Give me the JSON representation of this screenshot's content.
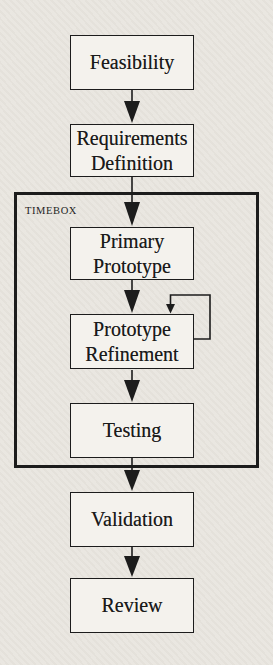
{
  "diagram": {
    "type": "flowchart",
    "colors": {
      "background": "#e9e6e0",
      "node_fill": "#f4f2ed",
      "border": "#1c1c1c",
      "text": "#1a1a1a"
    },
    "nodes": [
      {
        "id": "feasibility",
        "label": "Feasibility"
      },
      {
        "id": "requirements-definition",
        "label": "Requirements Definition"
      },
      {
        "id": "primary-prototype",
        "label": "Primary Prototype"
      },
      {
        "id": "prototype-refinement",
        "label": "Prototype Refinement"
      },
      {
        "id": "testing",
        "label": "Testing"
      },
      {
        "id": "validation",
        "label": "Validation"
      },
      {
        "id": "review",
        "label": "Review"
      }
    ],
    "container": {
      "label": "TIMEBOX",
      "contains": [
        "primary-prototype",
        "prototype-refinement",
        "testing"
      ]
    },
    "edges": [
      {
        "from": "feasibility",
        "to": "requirements-definition"
      },
      {
        "from": "requirements-definition",
        "to": "primary-prototype"
      },
      {
        "from": "primary-prototype",
        "to": "prototype-refinement"
      },
      {
        "from": "prototype-refinement",
        "to": "prototype-refinement",
        "type": "self-loop"
      },
      {
        "from": "prototype-refinement",
        "to": "testing"
      },
      {
        "from": "testing",
        "to": "validation"
      },
      {
        "from": "validation",
        "to": "review"
      }
    ]
  }
}
